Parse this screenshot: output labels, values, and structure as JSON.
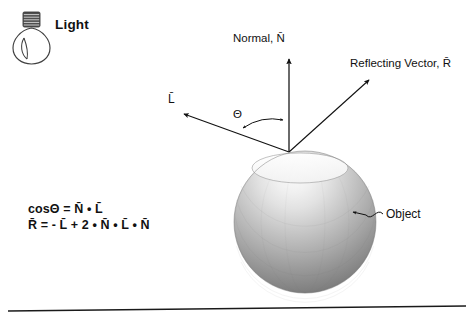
{
  "figure": {
    "title_hidden": "",
    "background_color": "#ffffff",
    "ink_color": "#111111"
  },
  "light_source": {
    "label": "Light",
    "icon": "lightbulb-icon",
    "base_color": "#4a4a4a",
    "glass_color": "#ffffff"
  },
  "labels": {
    "normal": "Normal, N̄",
    "reflecting_vector": "Reflecting Vector, R̄",
    "light_vector": "L̄",
    "theta": "Θ",
    "object": "Object"
  },
  "equations": {
    "line1": {
      "lhs": "cosΘ",
      "eq": "=",
      "terms": [
        "N̄",
        "•",
        "L̄"
      ],
      "plain": "cosΘ = N̄ • L̄"
    },
    "line2": {
      "lhs": "R̄",
      "eq": "=",
      "terms": [
        "-",
        "L̄",
        "+",
        "2",
        "•",
        "N̄",
        "•",
        "L̄",
        "•",
        "N̄"
      ],
      "plain": "R̄ = - L̄ + 2 • N̄ • L̄ • N̄"
    }
  },
  "geometry": {
    "origin_point": {
      "x": 289,
      "y": 152
    },
    "normal_vector": {
      "tip_x": 289,
      "tip_y": 55
    },
    "light_vector": {
      "tip_x": 179,
      "tip_y": 111
    },
    "reflecting_vector": {
      "tip_x": 373,
      "tip_y": 76
    },
    "sphere": {
      "cx": 305,
      "cy": 222,
      "r": 71
    },
    "ground_line": {
      "x1": 8,
      "y1": 311,
      "x2": 466,
      "y2": 306
    }
  },
  "sphere_shading": {
    "highlight_color": "#f5f5f5",
    "mid_color": "#b4b4b4",
    "shadow_color": "#6e6e6e",
    "edge_color": "#5a5a5a"
  }
}
